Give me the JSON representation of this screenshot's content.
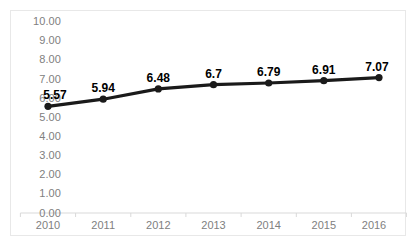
{
  "chart_data": {
    "type": "line",
    "title": "",
    "subtitle": "",
    "xlabel": "",
    "ylabel": "",
    "categories": [
      "2010",
      "2011",
      "2012",
      "2013",
      "2014",
      "2015",
      "2016"
    ],
    "values": [
      5.57,
      5.94,
      6.48,
      6.7,
      6.79,
      6.91,
      7.07
    ],
    "point_labels": [
      "5.57",
      "5.94",
      "6.48",
      "6.7",
      "6.79",
      "6.91",
      "7.07"
    ],
    "ylim": [
      0,
      10
    ],
    "ytick_step": 1,
    "ytick_labels": [
      "10.00",
      "9.00",
      "8.00",
      "7.00",
      "6.00",
      "5.00",
      "4.00",
      "3.00",
      "2.00",
      "1.00",
      "0.00"
    ],
    "ytick_values": [
      10,
      9,
      8,
      7,
      6,
      5,
      4,
      3,
      2,
      1,
      0
    ],
    "grid": false,
    "legend": "none",
    "series": [
      {
        "name": "",
        "values": [
          5.57,
          5.94,
          6.48,
          6.7,
          6.79,
          6.91,
          7.07
        ],
        "line_color": "#1a1a1a",
        "marker": "circle",
        "marker_color": "#1a1a1a"
      }
    ],
    "colors": {
      "line": "#1a1a1a",
      "marker": "#1a1a1a",
      "axis": "#d9d9d9",
      "tick_text": "#808080",
      "data_label": "#000000",
      "plot_background": "#ffffff",
      "frame_border": "#e8e8e8"
    }
  }
}
